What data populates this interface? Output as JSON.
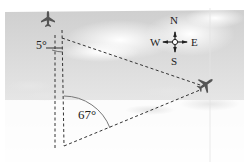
{
  "diagram": {
    "type": "navigation-bearing-triangle",
    "angles": {
      "top_angle_label": "5°",
      "bottom_angle_label": "67°"
    },
    "compass": {
      "north": "N",
      "south": "S",
      "east": "E",
      "west": "W"
    },
    "objects": [
      {
        "name": "airplane-top",
        "heading": "north"
      },
      {
        "name": "airplane-right",
        "heading": "northeast"
      }
    ],
    "colors": {
      "sky": "#d9d9d9",
      "cloud": "#f4f4f4",
      "line": "#333333",
      "arc": "#777777"
    }
  }
}
